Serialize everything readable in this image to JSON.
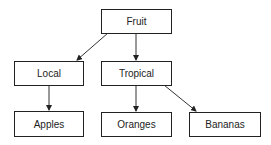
{
  "diagram": {
    "type": "tree",
    "nodes": [
      {
        "id": "fruit",
        "label": "Fruit"
      },
      {
        "id": "local",
        "label": "Local"
      },
      {
        "id": "tropical",
        "label": "Tropical"
      },
      {
        "id": "apples",
        "label": "Apples"
      },
      {
        "id": "oranges",
        "label": "Oranges"
      },
      {
        "id": "bananas",
        "label": "Bananas"
      }
    ],
    "edges": [
      {
        "from": "Fruit",
        "to": "Local"
      },
      {
        "from": "Fruit",
        "to": "Tropical"
      },
      {
        "from": "Local",
        "to": "Apples"
      },
      {
        "from": "Tropical",
        "to": "Oranges"
      },
      {
        "from": "Tropical",
        "to": "Bananas"
      }
    ]
  }
}
